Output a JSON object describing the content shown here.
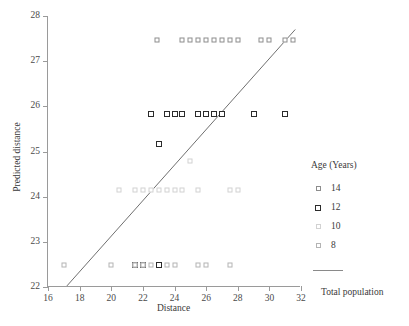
{
  "chart_data": {
    "type": "scatter",
    "title": "",
    "xlabel": "Distance",
    "ylabel": "Predicted distance",
    "xlim": [
      16,
      32
    ],
    "ylim": [
      22,
      28
    ],
    "xticks": [
      16,
      18,
      20,
      22,
      24,
      26,
      28,
      30,
      32
    ],
    "yticks": [
      22,
      23,
      24,
      25,
      26,
      27,
      28
    ],
    "grid": false,
    "legend_position": "right",
    "legend_title": "Age (Years)",
    "series": [
      {
        "name": "14",
        "age": 14,
        "color": "#8d8d8d",
        "marker": "square-open",
        "points": [
          {
            "x": 22.9,
            "y": 27.47
          },
          {
            "x": 24.5,
            "y": 27.47
          },
          {
            "x": 25.0,
            "y": 27.47
          },
          {
            "x": 25.5,
            "y": 27.47
          },
          {
            "x": 26.0,
            "y": 27.47
          },
          {
            "x": 26.5,
            "y": 27.47
          },
          {
            "x": 27.0,
            "y": 27.47
          },
          {
            "x": 27.5,
            "y": 27.47
          },
          {
            "x": 28.0,
            "y": 27.47
          },
          {
            "x": 29.5,
            "y": 27.47
          },
          {
            "x": 30.0,
            "y": 27.47
          },
          {
            "x": 31.0,
            "y": 27.47
          },
          {
            "x": 31.5,
            "y": 27.47
          }
        ]
      },
      {
        "name": "12",
        "age": 12,
        "color": "#2b2b2b",
        "marker": "square-open-bold",
        "points": [
          {
            "x": 22.5,
            "y": 25.83
          },
          {
            "x": 23.5,
            "y": 25.83
          },
          {
            "x": 24.0,
            "y": 25.83
          },
          {
            "x": 24.5,
            "y": 25.83
          },
          {
            "x": 25.5,
            "y": 25.83
          },
          {
            "x": 26.0,
            "y": 25.83
          },
          {
            "x": 26.5,
            "y": 25.83
          },
          {
            "x": 27.0,
            "y": 25.83
          },
          {
            "x": 29.0,
            "y": 25.83
          },
          {
            "x": 31.0,
            "y": 25.83
          },
          {
            "x": 23.0,
            "y": 25.17
          },
          {
            "x": 21.5,
            "y": 22.48
          },
          {
            "x": 22.0,
            "y": 22.48
          },
          {
            "x": 23.0,
            "y": 22.48
          }
        ]
      },
      {
        "name": "10",
        "age": 10,
        "color": "#d2d2d2",
        "marker": "square-open-light",
        "points": [
          {
            "x": 20.5,
            "y": 24.14
          },
          {
            "x": 21.5,
            "y": 24.14
          },
          {
            "x": 22.0,
            "y": 24.14
          },
          {
            "x": 22.5,
            "y": 24.14
          },
          {
            "x": 23.0,
            "y": 24.14
          },
          {
            "x": 23.5,
            "y": 24.14
          },
          {
            "x": 24.0,
            "y": 24.14
          },
          {
            "x": 24.5,
            "y": 24.14
          },
          {
            "x": 25.5,
            "y": 24.14
          },
          {
            "x": 27.5,
            "y": 24.14
          },
          {
            "x": 28.0,
            "y": 24.14
          },
          {
            "x": 25.0,
            "y": 24.79
          }
        ]
      },
      {
        "name": "8",
        "age": 8,
        "color": "#b4b4b4",
        "marker": "square-open",
        "points": [
          {
            "x": 17.0,
            "y": 22.48
          },
          {
            "x": 20.0,
            "y": 22.48
          },
          {
            "x": 21.5,
            "y": 22.48
          },
          {
            "x": 22.0,
            "y": 22.48
          },
          {
            "x": 22.5,
            "y": 22.48
          },
          {
            "x": 23.5,
            "y": 22.48
          },
          {
            "x": 24.0,
            "y": 22.48
          },
          {
            "x": 25.5,
            "y": 22.48
          },
          {
            "x": 26.0,
            "y": 22.48
          },
          {
            "x": 27.5,
            "y": 22.48
          }
        ]
      }
    ],
    "trendline": {
      "name": "Total population",
      "color": "#6e6e6e",
      "x0": 17.2,
      "y0": 22.0,
      "x1": 31.7,
      "y1": 27.7
    },
    "annotations": []
  },
  "legend": {
    "title": "Age (Years)",
    "items": [
      {
        "label": "14",
        "cls": "a14"
      },
      {
        "label": "12",
        "cls": "a12"
      },
      {
        "label": "10",
        "cls": "a10"
      },
      {
        "label": "8",
        "cls": "a8"
      }
    ],
    "line_label": "Total population"
  },
  "axes": {
    "x_title": "Distance",
    "y_title": "Predicted distance"
  }
}
